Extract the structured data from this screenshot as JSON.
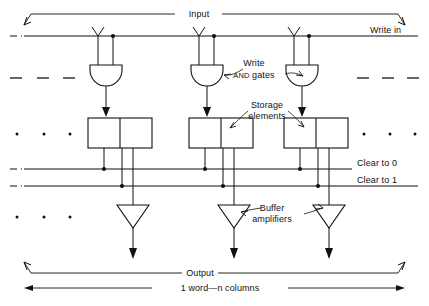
{
  "figure": {
    "title_top": "Input",
    "title_bottom": "Output",
    "width_label_prefix": "1 word—",
    "width_label_italic": "n",
    "width_label_suffix": " columns",
    "bus_lines": [
      {
        "name": "write-in",
        "label": "Write in",
        "y": 36
      },
      {
        "name": "clear-to-0",
        "label": "Clear to 0",
        "y": 169
      },
      {
        "name": "clear-to-1",
        "label": "Clear to 1",
        "y": 186
      }
    ],
    "callouts": [
      {
        "name": "write-and-gates",
        "line1": "Write",
        "line2_small": "AND",
        "line2_rest": " gates"
      },
      {
        "name": "storage-elements",
        "line1": "Storage",
        "line2": "elements"
      },
      {
        "name": "buffer-amplifiers",
        "line1": "Buffer",
        "line2": "amplifiers"
      }
    ],
    "columns": [
      {
        "name": "column-1",
        "input_x": 98,
        "tap_x": 113,
        "box_left": 88,
        "box_right": 152,
        "box_div": 120
      },
      {
        "name": "column-2",
        "input_x": 199,
        "tap_x": 214,
        "box_left": 189,
        "box_right": 253,
        "box_div": 221
      },
      {
        "name": "column-3",
        "input_x": 294,
        "tap_x": 309,
        "box_left": 284,
        "box_right": 348,
        "box_div": 316
      }
    ],
    "ellipsis": {
      "dash_left_x": [
        15,
        42,
        68
      ],
      "dash_right_x": [
        362,
        388,
        412
      ],
      "dash_y": 78,
      "dot_left_x": [
        17,
        44,
        70
      ],
      "dot_right_x": [
        364,
        390,
        415
      ],
      "dot_y_storage": 134,
      "dot_y_buffer": 217
    },
    "colors": {
      "ink": "#111111",
      "paper": "#ffffff"
    }
  }
}
